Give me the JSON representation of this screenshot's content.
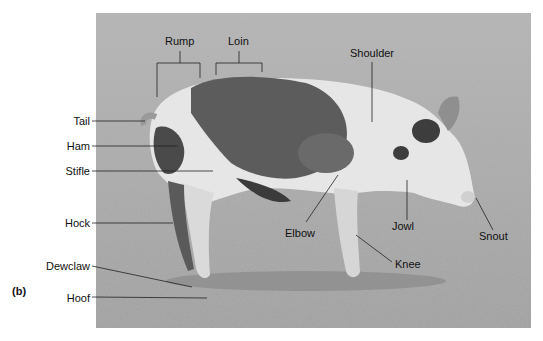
{
  "figure": {
    "panel_label": "(b)",
    "photo_description": "Side view of a spotted pig standing on dirt ground, facing right",
    "labels": [
      {
        "id": "rump",
        "text": "Rump"
      },
      {
        "id": "loin",
        "text": "Loin"
      },
      {
        "id": "shoulder",
        "text": "Shoulder"
      },
      {
        "id": "tail",
        "text": "Tail"
      },
      {
        "id": "ham",
        "text": "Ham"
      },
      {
        "id": "stifle",
        "text": "Stifle"
      },
      {
        "id": "hock",
        "text": "Hock"
      },
      {
        "id": "dewclaw",
        "text": "Dewclaw"
      },
      {
        "id": "hoof",
        "text": "Hoof"
      },
      {
        "id": "elbow",
        "text": "Elbow"
      },
      {
        "id": "jowl",
        "text": "Jowl"
      },
      {
        "id": "knee",
        "text": "Knee"
      },
      {
        "id": "snout",
        "text": "Snout"
      }
    ]
  }
}
